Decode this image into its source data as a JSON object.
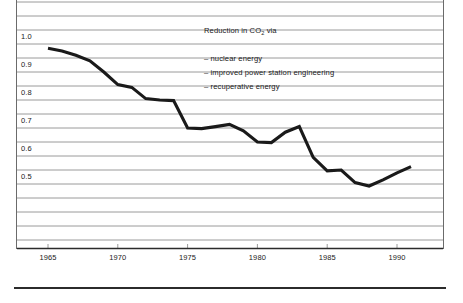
{
  "chart_data": {
    "type": "line",
    "title": "",
    "subtitle": "",
    "xlabel": "",
    "ylabel": "",
    "xlim": [
      1964.6,
      1991.6
    ],
    "ylim": [
      0.35,
      1.05
    ],
    "grid": true,
    "grid_step": 0.05,
    "legend_position": "none",
    "x_tick_labels": [
      "1965",
      "1970",
      "1975",
      "1980",
      "1985",
      "1990"
    ],
    "x_ticks": [
      1965,
      1970,
      1975,
      1980,
      1985,
      1990
    ],
    "y_tick_labels": [
      "1.0",
      "0.9",
      "0.8",
      "0.7",
      "0.6",
      "0.5"
    ],
    "y_ticks": [
      1.0,
      0.9,
      0.8,
      0.7,
      0.6,
      0.5
    ],
    "series": [
      {
        "name": "Specific CO2 emission index",
        "color": "#1a1a1a",
        "x": [
          1965,
          1966,
          1967,
          1968,
          1969,
          1970,
          1971,
          1972,
          1973,
          1974,
          1975,
          1976,
          1977,
          1978,
          1979,
          1980,
          1981,
          1982,
          1983,
          1984,
          1985,
          1986,
          1987,
          1988,
          1989,
          1990,
          1991
        ],
        "values": [
          0.935,
          0.925,
          0.91,
          0.89,
          0.85,
          0.805,
          0.795,
          0.755,
          0.75,
          0.748,
          0.65,
          0.648,
          0.655,
          0.663,
          0.64,
          0.6,
          0.598,
          0.635,
          0.655,
          0.545,
          0.497,
          0.5,
          0.455,
          0.443,
          0.465,
          0.49,
          0.512
        ]
      }
    ],
    "annotations": [
      {
        "id": "annotation-title",
        "text": "Reduction in CO2 via",
        "text_parts": {
          "before": "Reduction in CO",
          "sub": "2",
          "after": " via"
        }
      },
      {
        "id": "annotation-item-1",
        "text": "– nuclear energy"
      },
      {
        "id": "annotation-item-2",
        "text": "– improved power station engineering"
      },
      {
        "id": "annotation-item-3",
        "text": "– recuperative energy"
      }
    ],
    "colors": {
      "line": "#1a1a1a",
      "grid": "#9a9a9a",
      "axis": "#2b2b2b",
      "text": "#1a1a1a",
      "background": "#ffffff"
    }
  },
  "axis": {
    "y_labels": [
      "1.0",
      "0.9",
      "0.8",
      "0.7",
      "0.6",
      "0.5"
    ],
    "x_labels": [
      "1965",
      "1970",
      "1975",
      "1980",
      "1985",
      "1990"
    ]
  },
  "annotations": {
    "title_before": "Reduction in CO",
    "title_sub": "2",
    "title_after": " via",
    "item1": "– nuclear energy",
    "item2": "– improved power station engineering",
    "item3": "– recuperative energy"
  }
}
